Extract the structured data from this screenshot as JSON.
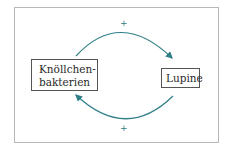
{
  "diagram": {
    "type": "feedback-loop",
    "nodes": [
      {
        "id": "left",
        "label": "Knöllchen-\nbakterien",
        "line1": "Knöllchen-",
        "line2": "bakterien"
      },
      {
        "id": "right",
        "label": "Lupine"
      }
    ],
    "edges": [
      {
        "from": "left",
        "to": "right",
        "sign": "+"
      },
      {
        "from": "right",
        "to": "left",
        "sign": "+"
      }
    ],
    "colors": {
      "arrow": "#2f7f87",
      "node_border": "#555555",
      "frame_border": "#b8b8b8"
    }
  }
}
